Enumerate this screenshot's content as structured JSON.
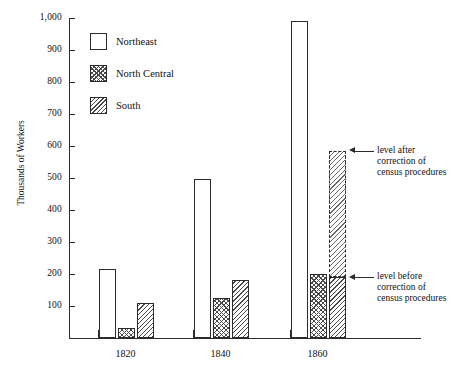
{
  "chart_data": {
    "type": "bar",
    "title": "",
    "xlabel": "",
    "ylabel": "Thousands of Workers",
    "categories": [
      "1820",
      "1840",
      "1860"
    ],
    "ylim": [
      0,
      1000
    ],
    "yticks": [
      "100",
      "200",
      "300",
      "400",
      "500",
      "600",
      "700",
      "800",
      "900",
      "1,000"
    ],
    "grid": false,
    "legend_position": "top-left",
    "series": [
      {
        "name": "Northeast",
        "pattern": "plain",
        "values": [
          215,
          497,
          990
        ]
      },
      {
        "name": "North Central",
        "pattern": "cross",
        "values": [
          32,
          125,
          200
        ]
      },
      {
        "name": "South",
        "pattern": "diag",
        "values": [
          108,
          180,
          190
        ]
      }
    ],
    "annotations": [
      {
        "id": "level-after",
        "lines": [
          "level after",
          "correction of",
          "census procedures"
        ],
        "value": 585,
        "target_series": "South",
        "target_category": "1860"
      },
      {
        "id": "level-before",
        "lines": [
          "level before",
          "correction of",
          "census procedures"
        ],
        "value": 190,
        "target_series": "South",
        "target_category": "1860"
      }
    ],
    "south_1860_corrected_level": 585
  },
  "legend": {
    "items": [
      {
        "label": "Northeast",
        "pattern": "plain"
      },
      {
        "label": "North Central",
        "pattern": "cross"
      },
      {
        "label": "South",
        "pattern": "diag"
      }
    ]
  },
  "axes": {
    "y_title": "Thousands of Workers",
    "y_tick_labels": [
      "1,000",
      "900",
      "800",
      "700",
      "600",
      "500",
      "400",
      "300",
      "200",
      "100"
    ],
    "x_tick_labels": [
      "1820",
      "1840",
      "1860"
    ]
  }
}
